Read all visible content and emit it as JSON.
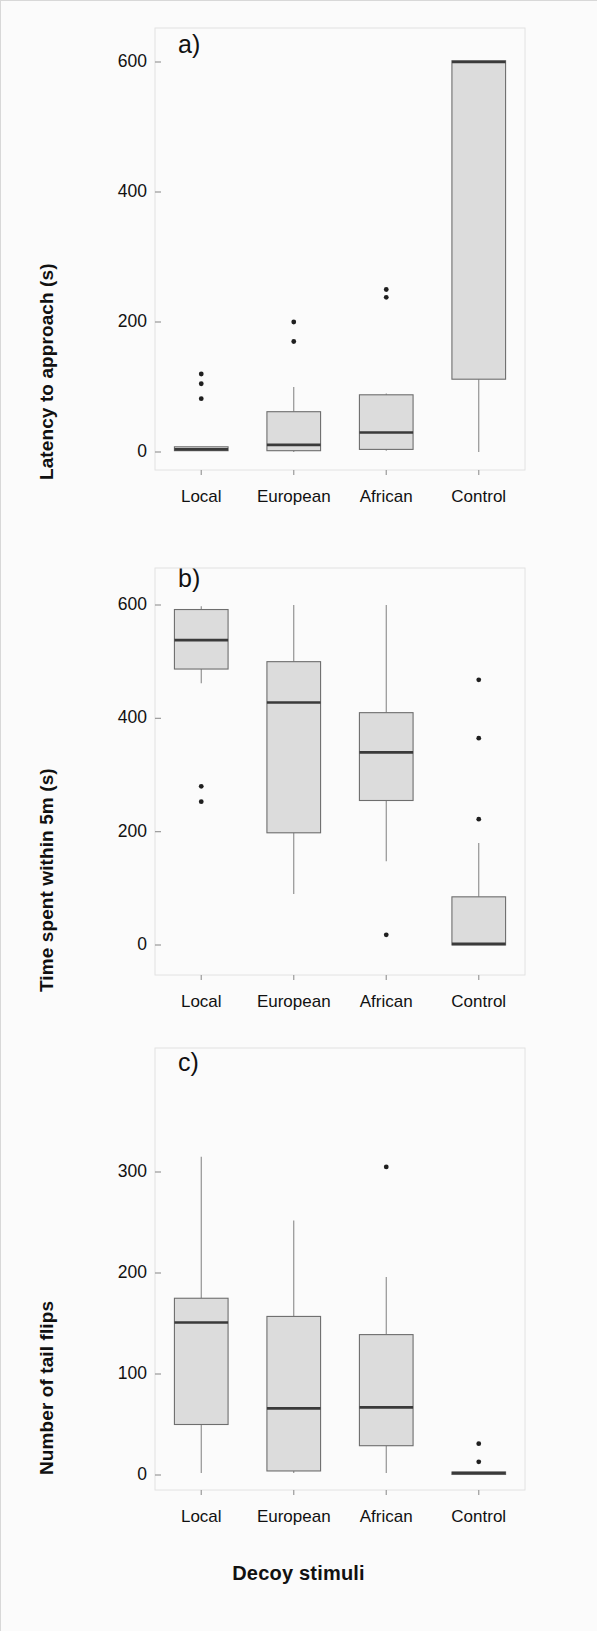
{
  "figure": {
    "xaxis_title": "Decoy stimuli",
    "categories": [
      "Local",
      "European",
      "African",
      "Control"
    ]
  },
  "panels": [
    {
      "letter": "a)",
      "ylabel": "Latency to approach (s)",
      "yticks": [
        "0",
        "200",
        "400",
        "600"
      ]
    },
    {
      "letter": "b)",
      "ylabel": "Time spent within 5m (s)",
      "yticks": [
        "0",
        "200",
        "400",
        "600"
      ]
    },
    {
      "letter": "c)",
      "ylabel": "Number of tail flips",
      "yticks": [
        "0",
        "100",
        "200",
        "300"
      ]
    }
  ],
  "chart_data": [
    {
      "type": "box",
      "panel": "a",
      "title": "a)",
      "xlabel": "Decoy stimuli",
      "ylabel": "Latency to approach (s)",
      "categories": [
        "Local",
        "European",
        "African",
        "Control"
      ],
      "ylim": [
        0,
        660
      ],
      "yticks": [
        0,
        200,
        400,
        600
      ],
      "grid": false,
      "legend": "none",
      "boxes": [
        {
          "category": "Local",
          "whisker_low": 2,
          "q1": 2,
          "median": 4,
          "q3": 8,
          "whisker_high": 8,
          "outliers": [
            82,
            105,
            120
          ]
        },
        {
          "category": "European",
          "whisker_low": 0,
          "q1": 2,
          "median": 11,
          "q3": 62,
          "whisker_high": 100,
          "outliers": [
            170,
            200
          ]
        },
        {
          "category": "African",
          "whisker_low": 2,
          "q1": 4,
          "median": 30,
          "q3": 88,
          "whisker_high": 90,
          "outliers": [
            238,
            250
          ]
        },
        {
          "category": "Control",
          "whisker_low": 0,
          "q1": 112,
          "median": 600,
          "q3": 602,
          "whisker_high": 602,
          "outliers": []
        }
      ]
    },
    {
      "type": "box",
      "panel": "b",
      "title": "b)",
      "xlabel": "Decoy stimuli",
      "ylabel": "Time spent within 5m (s)",
      "categories": [
        "Local",
        "European",
        "African",
        "Control"
      ],
      "ylim": [
        0,
        660
      ],
      "yticks": [
        0,
        200,
        400,
        600
      ],
      "grid": false,
      "legend": "none",
      "boxes": [
        {
          "category": "Local",
          "whisker_low": 462,
          "q1": 487,
          "median": 538,
          "q3": 592,
          "whisker_high": 598,
          "outliers": [
            253,
            280
          ]
        },
        {
          "category": "European",
          "whisker_low": 90,
          "q1": 198,
          "median": 428,
          "q3": 500,
          "whisker_high": 600,
          "outliers": []
        },
        {
          "category": "African",
          "whisker_low": 148,
          "q1": 255,
          "median": 340,
          "q3": 410,
          "whisker_high": 600,
          "outliers": [
            18
          ]
        },
        {
          "category": "Control",
          "whisker_low": 0,
          "q1": 0,
          "median": 2,
          "q3": 85,
          "whisker_high": 180,
          "outliers": [
            222,
            365,
            468
          ]
        }
      ]
    },
    {
      "type": "box",
      "panel": "c",
      "title": "c)",
      "xlabel": "Decoy stimuli",
      "ylabel": "Number of tail flips",
      "categories": [
        "Local",
        "European",
        "African",
        "Control"
      ],
      "ylim": [
        0,
        345
      ],
      "yticks": [
        0,
        100,
        200,
        300
      ],
      "grid": false,
      "legend": "none",
      "boxes": [
        {
          "category": "Local",
          "whisker_low": 2,
          "q1": 50,
          "median": 151,
          "q3": 175,
          "whisker_high": 315,
          "outliers": []
        },
        {
          "category": "European",
          "whisker_low": 2,
          "q1": 4,
          "median": 66,
          "q3": 157,
          "whisker_high": 252,
          "outliers": []
        },
        {
          "category": "African",
          "whisker_low": 2,
          "q1": 29,
          "median": 67,
          "q3": 139,
          "whisker_high": 196,
          "outliers": [
            305
          ]
        },
        {
          "category": "Control",
          "whisker_low": 1,
          "q1": 1,
          "median": 2,
          "q3": 3,
          "whisker_high": 3,
          "outliers": [
            13,
            31
          ]
        }
      ]
    }
  ]
}
